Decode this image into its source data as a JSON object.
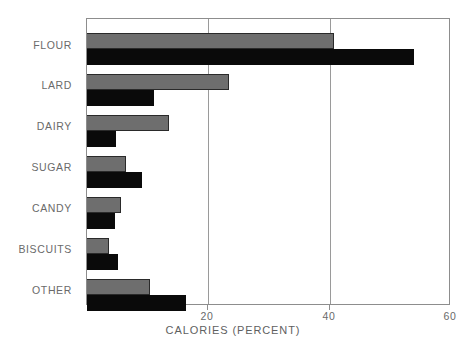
{
  "chart_data": {
    "type": "bar",
    "orientation": "horizontal",
    "title": "",
    "xlabel": "CALORIES (PERCENT)",
    "ylabel": "",
    "categories": [
      "FLOUR",
      "LARD",
      "DAIRY",
      "SUGAR",
      "CANDY",
      "BISCUITS",
      "OTHER"
    ],
    "series": [
      {
        "name": "gray",
        "color": "#6e6e6e",
        "values": [
          40.7,
          23.4,
          13.5,
          6.4,
          5.6,
          3.6,
          10.4
        ]
      },
      {
        "name": "black",
        "color": "#0a0a0a",
        "values": [
          53.9,
          11.0,
          4.8,
          9.1,
          4.6,
          5.1,
          16.3
        ]
      }
    ],
    "xlim": [
      0,
      60
    ],
    "xticks": [
      20,
      40,
      60
    ],
    "xtick_labels": [
      "20",
      "40",
      "60"
    ],
    "grid": true,
    "grid_axis": "x",
    "legend": false,
    "legend_position": "none"
  },
  "axis": {
    "x_title": "CALORIES (PERCENT)",
    "tick_20": "20",
    "tick_40": "40",
    "tick_60": "60"
  },
  "labels": {
    "flour": "FLOUR",
    "lard": "LARD",
    "dairy": "DAIRY",
    "sugar": "SUGAR",
    "candy": "CANDY",
    "biscuits": "BISCUITS",
    "other": "OTHER"
  },
  "colors": {
    "series_gray": "#6e6e6e",
    "series_black": "#0a0a0a",
    "axis": "#8d8d8d",
    "text": "#6a6a6a",
    "background": "#ffffff"
  }
}
